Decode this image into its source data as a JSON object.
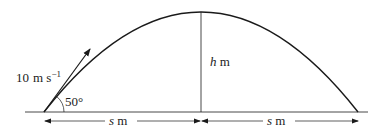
{
  "diagram": {
    "type": "projectile-motion",
    "velocity_label": {
      "value": "10",
      "unit": "m s",
      "exponent": "−1"
    },
    "angle_label": "50°",
    "height_label": {
      "var": "h",
      "unit": " m"
    },
    "left_distance": {
      "var": "s",
      "unit": " m"
    },
    "right_distance": {
      "var": "s",
      "unit": " m"
    },
    "colors": {
      "stroke": "#1a1a1a",
      "text": "#222222",
      "background": "#ffffff"
    }
  }
}
